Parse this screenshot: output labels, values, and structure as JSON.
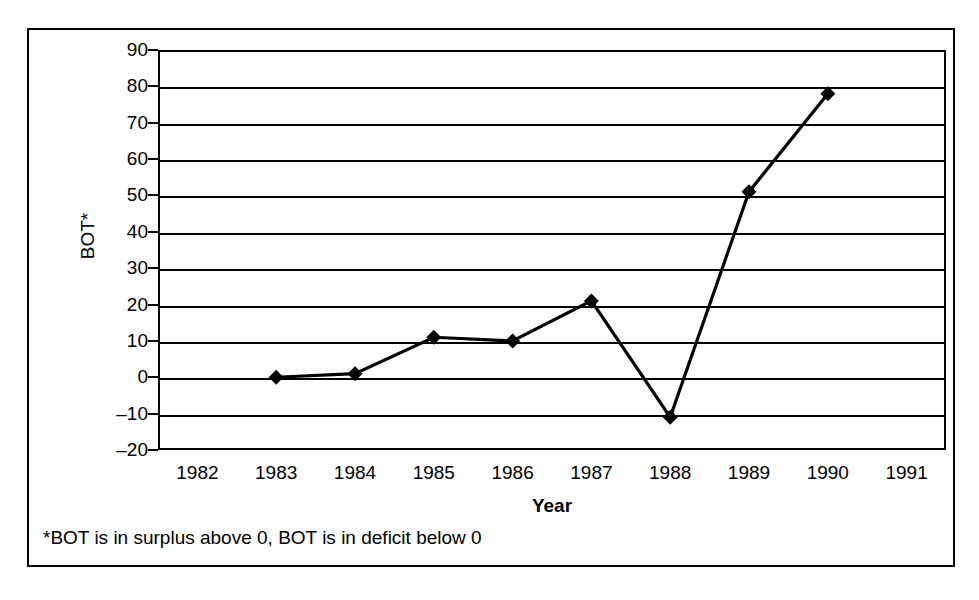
{
  "figure": {
    "footnote": "*BOT is in surplus above 0, BOT is in deficit below 0"
  },
  "chart_data": {
    "type": "line",
    "title": "",
    "xlabel": "Year",
    "ylabel": "BOT*",
    "x_tick_labels": [
      "1982",
      "1983",
      "1984",
      "1985",
      "1986",
      "1987",
      "1988",
      "1989",
      "1990",
      "1991"
    ],
    "y_tick_labels": [
      "90",
      "80",
      "70",
      "60",
      "50",
      "40",
      "30",
      "20",
      "10",
      "0",
      "–10",
      "–20"
    ],
    "y_tick_values": [
      90,
      80,
      70,
      60,
      50,
      40,
      30,
      20,
      10,
      0,
      -10,
      -20
    ],
    "ylim": [
      -20,
      90
    ],
    "xlim": [
      "1982",
      "1991"
    ],
    "grid": "horizontal",
    "legend": "none",
    "marker": "diamond",
    "line_color": "#000000",
    "marker_color": "#000000",
    "categories": [
      "1983",
      "1984",
      "1985",
      "1986",
      "1987",
      "1988",
      "1989",
      "1990"
    ],
    "values": [
      0,
      1,
      11,
      10,
      21,
      -11,
      51,
      78
    ],
    "series": [
      {
        "name": "BOT",
        "points": [
          {
            "x": "1983",
            "y": 0
          },
          {
            "x": "1984",
            "y": 1
          },
          {
            "x": "1985",
            "y": 11
          },
          {
            "x": "1986",
            "y": 10
          },
          {
            "x": "1987",
            "y": 21
          },
          {
            "x": "1988",
            "y": -11
          },
          {
            "x": "1989",
            "y": 51
          },
          {
            "x": "1990",
            "y": 78
          }
        ]
      }
    ]
  }
}
